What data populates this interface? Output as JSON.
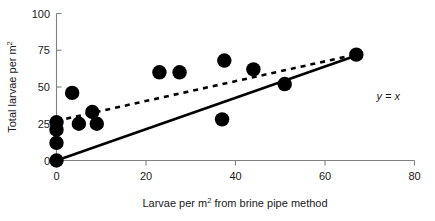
{
  "chart_data": {
    "type": "scatter",
    "title": "",
    "xlabel": "Larvae per m2 from brine pipe method",
    "xlabel_pre": "Larvae per m",
    "xlabel_sup": "2",
    "xlabel_post": " from brine pipe method",
    "ylabel": "Total larvae per m2",
    "ylabel_pre": "Total larvae per m",
    "ylabel_sup": "2",
    "xlim": [
      0,
      80
    ],
    "ylim": [
      0,
      100
    ],
    "xticks": [
      0,
      20,
      40,
      60,
      80
    ],
    "yticks": [
      0,
      25,
      50,
      75,
      100
    ],
    "xtick_labels": [
      "0",
      "20",
      "40",
      "60",
      "80"
    ],
    "ytick_labels": [
      "0",
      "25",
      "50",
      "75",
      "100"
    ],
    "grid": false,
    "legend": "none",
    "marker": "filled-circle",
    "marker_color": "#000000",
    "points": [
      {
        "x": 0.0,
        "y": 0.0
      },
      {
        "x": 0.0,
        "y": 12.0
      },
      {
        "x": 0.0,
        "y": 21.0
      },
      {
        "x": 0.0,
        "y": 26.0
      },
      {
        "x": 3.5,
        "y": 46.0
      },
      {
        "x": 5.0,
        "y": 25.0
      },
      {
        "x": 8.0,
        "y": 33.0
      },
      {
        "x": 9.0,
        "y": 25.0
      },
      {
        "x": 23.0,
        "y": 60.0
      },
      {
        "x": 27.5,
        "y": 60.0
      },
      {
        "x": 37.0,
        "y": 28.0
      },
      {
        "x": 37.5,
        "y": 68.0
      },
      {
        "x": 44.0,
        "y": 62.0
      },
      {
        "x": 51.0,
        "y": 52.0
      },
      {
        "x": 67.0,
        "y": 72.0
      }
    ],
    "lines": [
      {
        "name": "regression-fit",
        "style": "dashed",
        "color": "#000000",
        "x0": 0.0,
        "y0": 27.0,
        "x1": 67.5,
        "y1": 72.5
      },
      {
        "name": "identity-line",
        "style": "solid",
        "color": "#000000",
        "label": "y = x",
        "x0": 0.0,
        "y0": 0.0,
        "x1": 67.5,
        "y1": 72.0
      }
    ],
    "annotations": [
      {
        "name": "identity-line-label",
        "text": "y = x",
        "x": 71.5,
        "y": 41.0
      }
    ]
  }
}
